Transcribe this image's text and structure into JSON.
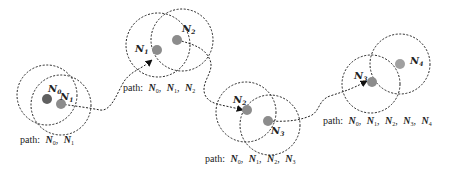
{
  "diagram": {
    "type": "path-expansion-over-overlapping-ranges",
    "colors": {
      "circle": "#222222",
      "node": "#8c8c8c",
      "node_start": "#666666",
      "path": "#222222",
      "text": "#222222"
    },
    "clusters": [
      {
        "id": "c1",
        "nodes": [
          {
            "label": "N",
            "sub": "0"
          },
          {
            "label": "N",
            "sub": "1"
          }
        ],
        "path_caption": {
          "prefix": "path:",
          "items": [
            {
              "label": "N",
              "sub": "0"
            },
            {
              "label": "N",
              "sub": "1"
            }
          ]
        }
      },
      {
        "id": "c2",
        "nodes": [
          {
            "label": "N",
            "sub": "1"
          },
          {
            "label": "N",
            "sub": "2"
          }
        ],
        "path_caption": {
          "prefix": "path:",
          "items": [
            {
              "label": "N",
              "sub": "0"
            },
            {
              "label": "N",
              "sub": "1"
            },
            {
              "label": "N",
              "sub": "2"
            }
          ]
        }
      },
      {
        "id": "c3",
        "nodes": [
          {
            "label": "N",
            "sub": "2"
          },
          {
            "label": "N",
            "sub": "3"
          }
        ],
        "path_caption": {
          "prefix": "path:",
          "items": [
            {
              "label": "N",
              "sub": "0"
            },
            {
              "label": "N",
              "sub": "1"
            },
            {
              "label": "N",
              "sub": "2"
            },
            {
              "label": "N",
              "sub": "3"
            }
          ]
        }
      },
      {
        "id": "c4",
        "nodes": [
          {
            "label": "N",
            "sub": "3"
          },
          {
            "label": "N",
            "sub": "4"
          }
        ],
        "path_caption": {
          "prefix": "path:",
          "items": [
            {
              "label": "N",
              "sub": "0"
            },
            {
              "label": "N",
              "sub": "1"
            },
            {
              "label": "N",
              "sub": "2"
            },
            {
              "label": "N",
              "sub": "3"
            },
            {
              "label": "N",
              "sub": "4"
            }
          ]
        }
      }
    ],
    "separator": ", "
  }
}
